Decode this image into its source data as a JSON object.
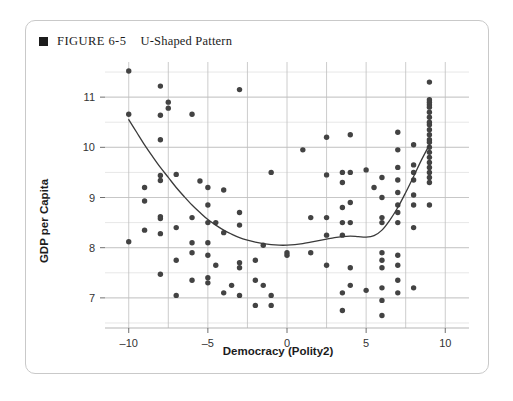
{
  "figure": {
    "bullet_icon": "filled-square-icon",
    "label": "FIGURE 6-5",
    "title": "U-Shaped Pattern"
  },
  "chart_data": {
    "type": "scatter",
    "title": "U-Shaped Pattern",
    "xlabel": "Democracy (Polity2)",
    "ylabel": "GDP per Capita",
    "xlim": [
      -11.5,
      11.5
    ],
    "ylim": [
      6.4,
      11.7
    ],
    "xticks": [
      -10,
      -5,
      0,
      5,
      10
    ],
    "xtick_labels": [
      "–10",
      "–5",
      "0",
      "5",
      "10"
    ],
    "yticks": [
      7,
      8,
      9,
      10,
      11
    ],
    "ytick_labels": [
      "7",
      "8",
      "9",
      "10",
      "11"
    ],
    "grid": true,
    "grid_minor_y_step": 0.5,
    "grid_major_x_step": 2.5,
    "legend": null,
    "marker_color": "#434343",
    "curve_color": "#3a3a3a",
    "points": [
      [
        -10.0,
        11.52
      ],
      [
        -10.0,
        10.66
      ],
      [
        -10.0,
        8.12
      ],
      [
        -9.0,
        9.2
      ],
      [
        -9.0,
        8.93
      ],
      [
        -9.0,
        8.35
      ],
      [
        -8.0,
        11.22
      ],
      [
        -8.0,
        10.64
      ],
      [
        -8.0,
        10.15
      ],
      [
        -8.0,
        9.44
      ],
      [
        -8.0,
        9.34
      ],
      [
        -8.0,
        8.62
      ],
      [
        -8.0,
        8.58
      ],
      [
        -8.0,
        8.28
      ],
      [
        -8.0,
        7.47
      ],
      [
        -7.5,
        10.9
      ],
      [
        -7.5,
        10.78
      ],
      [
        -7.0,
        9.46
      ],
      [
        -7.0,
        8.4
      ],
      [
        -7.0,
        7.75
      ],
      [
        -7.0,
        7.05
      ],
      [
        -6.0,
        10.66
      ],
      [
        -6.0,
        8.6
      ],
      [
        -6.0,
        8.1
      ],
      [
        -6.0,
        7.9
      ],
      [
        -6.0,
        7.35
      ],
      [
        -5.5,
        9.33
      ],
      [
        -5.0,
        9.2
      ],
      [
        -5.0,
        8.85
      ],
      [
        -5.0,
        8.5
      ],
      [
        -5.0,
        8.1
      ],
      [
        -5.0,
        7.85
      ],
      [
        -5.0,
        7.4
      ],
      [
        -5.0,
        7.3
      ],
      [
        -4.5,
        8.5
      ],
      [
        -4.5,
        7.65
      ],
      [
        -4.0,
        9.15
      ],
      [
        -4.0,
        8.3
      ],
      [
        -4.0,
        7.1
      ],
      [
        -3.5,
        7.25
      ],
      [
        -3.0,
        11.15
      ],
      [
        -3.0,
        8.7
      ],
      [
        -3.0,
        8.45
      ],
      [
        -3.0,
        7.7
      ],
      [
        -3.0,
        7.6
      ],
      [
        -3.0,
        7.05
      ],
      [
        -2.0,
        7.75
      ],
      [
        -2.0,
        7.35
      ],
      [
        -2.0,
        6.85
      ],
      [
        -1.5,
        8.05
      ],
      [
        -1.5,
        7.25
      ],
      [
        -1.0,
        9.5
      ],
      [
        -1.0,
        7.05
      ],
      [
        -1.0,
        6.85
      ],
      [
        0.0,
        7.9
      ],
      [
        0.0,
        7.85
      ],
      [
        1.0,
        9.95
      ],
      [
        1.5,
        8.6
      ],
      [
        1.5,
        7.9
      ],
      [
        2.5,
        10.2
      ],
      [
        2.5,
        9.45
      ],
      [
        2.5,
        8.6
      ],
      [
        2.5,
        8.25
      ],
      [
        2.5,
        7.65
      ],
      [
        3.5,
        9.5
      ],
      [
        3.5,
        9.3
      ],
      [
        3.5,
        8.8
      ],
      [
        3.5,
        8.5
      ],
      [
        3.5,
        8.25
      ],
      [
        3.5,
        7.1
      ],
      [
        3.5,
        6.75
      ],
      [
        4.0,
        10.25
      ],
      [
        4.0,
        9.5
      ],
      [
        4.0,
        8.9
      ],
      [
        4.0,
        8.5
      ],
      [
        4.0,
        7.6
      ],
      [
        4.0,
        7.25
      ],
      [
        5.0,
        9.55
      ],
      [
        5.0,
        7.15
      ],
      [
        5.5,
        9.2
      ],
      [
        6.0,
        9.4
      ],
      [
        6.0,
        9.0
      ],
      [
        6.0,
        8.6
      ],
      [
        6.0,
        8.5
      ],
      [
        6.0,
        7.9
      ],
      [
        6.0,
        7.75
      ],
      [
        6.0,
        7.6
      ],
      [
        6.0,
        7.2
      ],
      [
        6.0,
        6.95
      ],
      [
        6.0,
        6.65
      ],
      [
        7.0,
        10.3
      ],
      [
        7.0,
        9.95
      ],
      [
        7.0,
        9.6
      ],
      [
        7.0,
        9.35
      ],
      [
        7.0,
        9.1
      ],
      [
        7.0,
        8.85
      ],
      [
        7.0,
        8.7
      ],
      [
        7.0,
        8.5
      ],
      [
        7.0,
        7.85
      ],
      [
        7.0,
        7.65
      ],
      [
        7.0,
        7.35
      ],
      [
        7.0,
        7.1
      ],
      [
        8.0,
        10.05
      ],
      [
        8.0,
        9.65
      ],
      [
        8.0,
        9.5
      ],
      [
        8.0,
        9.35
      ],
      [
        8.0,
        9.05
      ],
      [
        8.0,
        8.85
      ],
      [
        8.0,
        8.4
      ],
      [
        8.0,
        7.2
      ],
      [
        9.0,
        11.3
      ],
      [
        9.0,
        10.95
      ],
      [
        9.0,
        10.9
      ],
      [
        9.0,
        10.85
      ],
      [
        9.0,
        10.8
      ],
      [
        9.0,
        10.7
      ],
      [
        9.0,
        10.6
      ],
      [
        9.0,
        10.5
      ],
      [
        9.0,
        10.45
      ],
      [
        9.0,
        10.35
      ],
      [
        9.0,
        10.25
      ],
      [
        9.0,
        10.15
      ],
      [
        9.0,
        10.1
      ],
      [
        9.0,
        10.0
      ],
      [
        9.0,
        9.9
      ],
      [
        9.0,
        9.8
      ],
      [
        9.0,
        9.7
      ],
      [
        9.0,
        9.6
      ],
      [
        9.0,
        9.5
      ],
      [
        9.0,
        9.4
      ],
      [
        9.0,
        9.3
      ],
      [
        9.0,
        8.85
      ]
    ],
    "curve": [
      [
        -10.0,
        10.55
      ],
      [
        -9.5,
        10.3
      ],
      [
        -9.0,
        10.05
      ],
      [
        -8.5,
        9.82
      ],
      [
        -8.0,
        9.6
      ],
      [
        -7.5,
        9.4
      ],
      [
        -7.0,
        9.2
      ],
      [
        -6.5,
        9.02
      ],
      [
        -6.0,
        8.85
      ],
      [
        -5.5,
        8.7
      ],
      [
        -5.0,
        8.56
      ],
      [
        -4.5,
        8.45
      ],
      [
        -4.0,
        8.35
      ],
      [
        -3.5,
        8.27
      ],
      [
        -3.0,
        8.2
      ],
      [
        -2.5,
        8.15
      ],
      [
        -2.0,
        8.11
      ],
      [
        -1.5,
        8.08
      ],
      [
        -1.0,
        8.06
      ],
      [
        -0.5,
        8.05
      ],
      [
        0.0,
        8.05
      ],
      [
        0.5,
        8.06
      ],
      [
        1.0,
        8.08
      ],
      [
        1.5,
        8.11
      ],
      [
        2.0,
        8.14
      ],
      [
        2.5,
        8.17
      ],
      [
        3.0,
        8.2
      ],
      [
        3.5,
        8.22
      ],
      [
        4.0,
        8.23
      ],
      [
        4.5,
        8.22
      ],
      [
        5.0,
        8.21
      ],
      [
        5.5,
        8.24
      ],
      [
        6.0,
        8.35
      ],
      [
        6.5,
        8.55
      ],
      [
        7.0,
        8.8
      ],
      [
        7.5,
        9.1
      ],
      [
        8.0,
        9.42
      ],
      [
        8.5,
        9.75
      ],
      [
        9.0,
        10.05
      ]
    ]
  }
}
